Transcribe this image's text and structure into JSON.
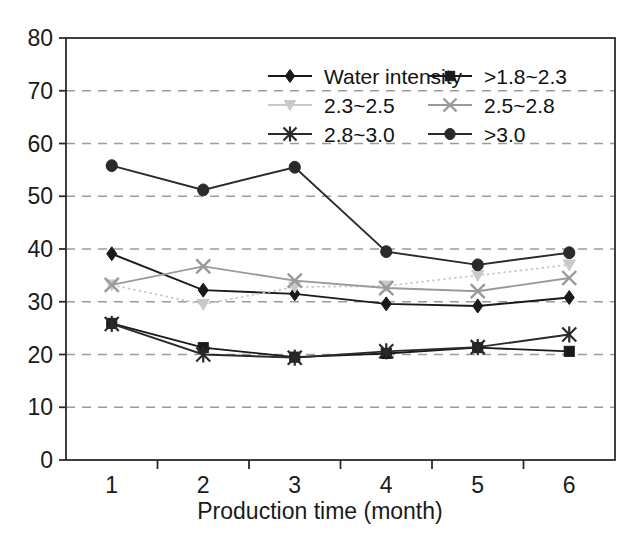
{
  "chart_data": {
    "type": "line",
    "title": "",
    "xlabel": "Production time (month)",
    "ylabel": "",
    "categories": [
      "1",
      "2",
      "3",
      "4",
      "5",
      "6"
    ],
    "x": [
      1,
      2,
      3,
      4,
      5,
      6
    ],
    "xlim": [
      0.5,
      6.5
    ],
    "ylim": [
      0,
      80
    ],
    "yticks": [
      "0",
      "10",
      "20",
      "30",
      "40",
      "50",
      "60",
      "70",
      "80"
    ],
    "ytick_values": [
      0,
      10,
      20,
      30,
      40,
      50,
      60,
      70,
      80
    ],
    "grid": "horizontal-dashed",
    "legend_position": "top-right-inside",
    "series": [
      {
        "name": "Water intensity",
        "marker": "diamond",
        "color": "#1a1a1a",
        "line": "solid",
        "values": [
          39.1,
          32.2,
          31.5,
          29.6,
          29.2,
          30.8
        ]
      },
      {
        "name": ">1.8~2.3",
        "marker": "square",
        "color": "#1a1a1a",
        "line": "solid",
        "values": [
          25.9,
          21.3,
          19.5,
          20.2,
          21.3,
          20.6
        ]
      },
      {
        "name": "2.3~2.5",
        "marker": "triangle",
        "color": "#c9c9c9",
        "line": "dotted",
        "values": [
          33.2,
          29.5,
          32.8,
          33.0,
          35.0,
          37.0
        ]
      },
      {
        "name": "2.5~2.8",
        "marker": "cross",
        "color": "#9a9a9a",
        "line": "solid",
        "values": [
          33.2,
          36.7,
          34.0,
          32.6,
          32.0,
          34.5
        ]
      },
      {
        "name": "2.8~3.0",
        "marker": "star",
        "color": "#2a2a2a",
        "line": "solid",
        "values": [
          25.8,
          20.0,
          19.4,
          20.6,
          21.4,
          23.8
        ]
      },
      {
        "name": ">3.0",
        "marker": "circle",
        "color": "#2a2a2a",
        "line": "solid",
        "values": [
          55.8,
          51.2,
          55.5,
          39.5,
          37.0,
          39.3
        ]
      }
    ]
  },
  "axes": {
    "y_tick_labels": [
      "80",
      "70",
      "60",
      "50",
      "40",
      "30",
      "20",
      "10",
      "0"
    ],
    "x_tick_labels": [
      "1",
      "2",
      "3",
      "4",
      "5",
      "6"
    ],
    "x_axis_title": "Production time (month)"
  },
  "legend": {
    "entries": [
      {
        "label": "Water intensity",
        "marker": "diamond",
        "color": "#1a1a1a"
      },
      {
        "label": ">1.8~2.3",
        "marker": "square",
        "color": "#1a1a1a"
      },
      {
        "label": "2.3~2.5",
        "marker": "triangle",
        "color": "#c9c9c9"
      },
      {
        "label": "2.5~2.8",
        "marker": "cross",
        "color": "#9a9a9a"
      },
      {
        "label": "2.8~3.0",
        "marker": "star",
        "color": "#2a2a2a"
      },
      {
        "label": ">3.0",
        "marker": "circle",
        "color": "#2a2a2a"
      }
    ]
  },
  "style": {
    "background": "#ffffff",
    "frame_color": "#2b2b2b",
    "grid_color": "#9b9b9b"
  }
}
